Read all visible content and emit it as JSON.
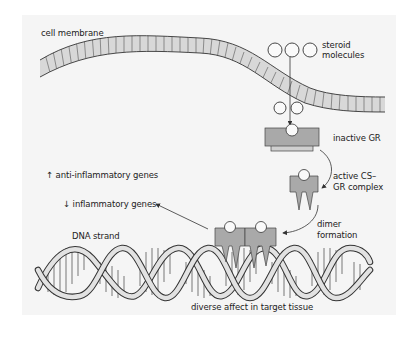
{
  "diagram": {
    "labels": {
      "cell_membrane": "cell membrane",
      "steroid_molecules_line1": "steroid",
      "steroid_molecules_line2": "molecules",
      "inactive_gr": "inactive GR",
      "active_complex_line1": "active CS–",
      "active_complex_line2": "GR complex",
      "dimer_line1": "dimer",
      "dimer_line2": "formation",
      "anti_inflammatory": "↑ anti-inflammatory genes",
      "inflammatory": "↓ inflammatory genes",
      "dna_strand": "DNA strand",
      "diverse_affect": "diverse affect in target tissue"
    },
    "colors": {
      "background": "#f5f5f5",
      "membrane_fill": "#d8d8d8",
      "receptor_fill": "#a9a9a9",
      "receptor_base": "#cfcfcf",
      "outline": "#333333",
      "dna_fill": "#e2e2e2"
    }
  }
}
